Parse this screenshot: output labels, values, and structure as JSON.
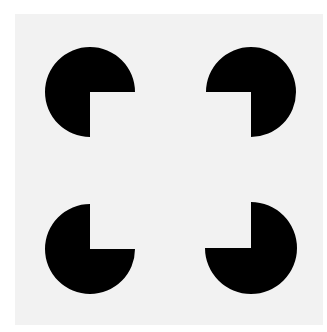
{
  "figure": {
    "background_color": "#ffffff",
    "panel_color": "#f2f2f2",
    "inducer_color": "#000000",
    "inducers": [
      {
        "position": "top-left",
        "cx": 90,
        "cy": 92,
        "r": 45,
        "missing_quadrant": "bottom-right"
      },
      {
        "position": "top-right",
        "cx": 251,
        "cy": 92,
        "r": 45,
        "missing_quadrant": "bottom-left"
      },
      {
        "position": "bottom-left",
        "cx": 90,
        "cy": 249,
        "r": 45,
        "missing_quadrant": "top-right"
      },
      {
        "position": "bottom-right",
        "cx": 251,
        "cy": 248,
        "r": 46,
        "missing_quadrant": "top-left"
      }
    ]
  }
}
